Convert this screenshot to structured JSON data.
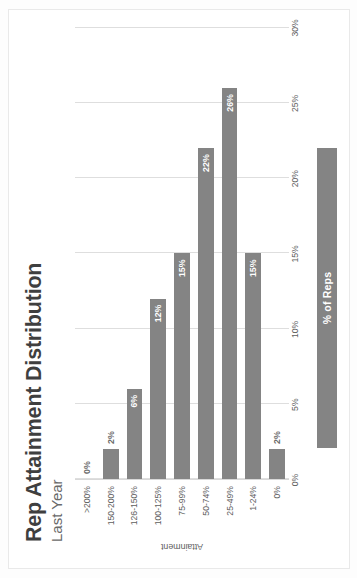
{
  "header": {
    "title": "Rep Attainment Distribution",
    "subtitle": "Last Year"
  },
  "legend": {
    "series_label": "% of Reps"
  },
  "axes": {
    "category_axis_title": "Attainment",
    "value_axis_ticks": [
      "0%",
      "5%",
      "10%",
      "15%",
      "20%",
      "25%",
      "30%"
    ]
  },
  "chart_data": {
    "type": "bar",
    "orientation": "horizontal",
    "title": "Rep Attainment Distribution",
    "subtitle": "Last Year",
    "xlabel": "",
    "ylabel": "Attainment",
    "xlim": [
      0,
      30
    ],
    "grid": true,
    "legend_position": "bottom",
    "categories": [
      "0%",
      "1-24%",
      "25-49%",
      "50-74%",
      "75-99%",
      "100-125%",
      "126-150%",
      "150-200%",
      ">200%"
    ],
    "series": [
      {
        "name": "% of Reps",
        "values": [
          2,
          15,
          26,
          22,
          15,
          12,
          6,
          2,
          0
        ],
        "data_labels": [
          "2%",
          "15%",
          "26%",
          "22%",
          "15%",
          "12%",
          "6%",
          "2%",
          "0%"
        ],
        "color": "#848484"
      }
    ]
  }
}
